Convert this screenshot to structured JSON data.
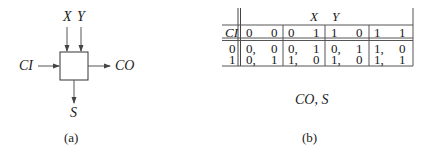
{
  "figure_a": {
    "inputs_top": [
      "X",
      "Y"
    ],
    "input_left": "CI",
    "output_right": "CO",
    "output_bottom": "S",
    "caption": "(a)"
  },
  "figure_b": {
    "column_group_label_x": "X",
    "column_group_label_y": "Y",
    "row_header": "CI",
    "columns": [
      {
        "x": "0",
        "y": "0"
      },
      {
        "x": "0",
        "y": "1"
      },
      {
        "x": "1",
        "y": "0"
      },
      {
        "x": "1",
        "y": "1"
      }
    ],
    "rows": [
      {
        "ci": "0",
        "cells": [
          [
            "0,",
            "0"
          ],
          [
            "0,",
            "1"
          ],
          [
            "0,",
            "1"
          ],
          [
            "1,",
            "0"
          ]
        ]
      },
      {
        "ci": "1",
        "cells": [
          [
            "0,",
            "1"
          ],
          [
            "1,",
            "0"
          ],
          [
            "1,",
            "0"
          ],
          [
            "1,",
            "1"
          ]
        ]
      }
    ],
    "output_label": "CO, S",
    "caption": "(b)"
  }
}
